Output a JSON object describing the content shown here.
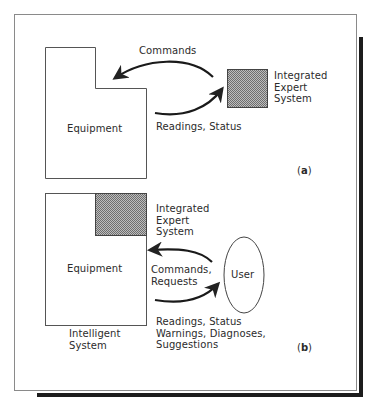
{
  "figure": {
    "panel_a": {
      "tag_open": "(",
      "tag_letter": "a",
      "tag_close": ")",
      "equipment_label": "Equipment",
      "expert_system_label": "Integrated\nExpert\nSystem",
      "arrow_top_label": "Commands",
      "arrow_bottom_label": "Readings, Status"
    },
    "panel_b": {
      "tag_open": "(",
      "tag_letter": "b",
      "tag_close": ")",
      "equipment_label": "Equipment",
      "expert_system_label": "Integrated\nExpert\nSystem",
      "user_label": "User",
      "arrow_top_label": "Commands,\nRequests",
      "arrow_bottom_label": "Readings, Status\nWarnings, Diagnoses,\nSuggestions",
      "system_caption": "Intelligent\nSystem"
    },
    "colors": {
      "frame": "#8a8a8a",
      "shadow": "#1a1a1a",
      "lines": "#333333",
      "hatch_fill": "#9a9a9a"
    }
  }
}
